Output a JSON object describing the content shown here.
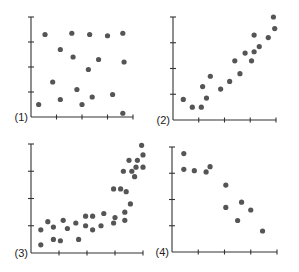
{
  "chart_data": [
    {
      "type": "scatter",
      "panel_label": "(1)",
      "description": "no correlation",
      "frame": {
        "x0": 31,
        "y0": 117,
        "x1": 133,
        "y1": 17
      },
      "xlim": [
        0,
        4
      ],
      "ylim": [
        0,
        4
      ],
      "x_ticks": 4,
      "y_ticks": 4,
      "points": [
        [
          0.3,
          0.5
        ],
        [
          0.55,
          3.3
        ],
        [
          0.85,
          1.4
        ],
        [
          1.15,
          2.7
        ],
        [
          1.15,
          0.7
        ],
        [
          1.6,
          3.35
        ],
        [
          1.65,
          2.4
        ],
        [
          1.8,
          1.1
        ],
        [
          2.0,
          0.5
        ],
        [
          2.3,
          3.3
        ],
        [
          2.25,
          1.9
        ],
        [
          2.4,
          0.8
        ],
        [
          2.65,
          2.3
        ],
        [
          3.0,
          3.25
        ],
        [
          3.2,
          0.9
        ],
        [
          3.6,
          3.35
        ],
        [
          3.65,
          2.2
        ],
        [
          3.6,
          0.15
        ]
      ]
    },
    {
      "type": "scatter",
      "panel_label": "(2)",
      "description": "positive correlation",
      "frame": {
        "x0": 173,
        "y0": 120,
        "x1": 276,
        "y1": 17
      },
      "xlim": [
        0,
        4
      ],
      "ylim": [
        0,
        4
      ],
      "x_ticks": 4,
      "y_ticks": 4,
      "points": [
        [
          0.4,
          0.8
        ],
        [
          0.75,
          0.5
        ],
        [
          1.1,
          0.5
        ],
        [
          1.15,
          1.3
        ],
        [
          1.3,
          0.85
        ],
        [
          1.45,
          1.7
        ],
        [
          1.85,
          1.2
        ],
        [
          2.2,
          1.5
        ],
        [
          2.4,
          2.3
        ],
        [
          2.6,
          1.8
        ],
        [
          2.8,
          2.6
        ],
        [
          3.05,
          2.3
        ],
        [
          3.15,
          2.65
        ],
        [
          3.15,
          3.3
        ],
        [
          3.35,
          2.85
        ],
        [
          3.7,
          3.2
        ],
        [
          3.95,
          3.55
        ],
        [
          3.9,
          4.0
        ]
      ]
    },
    {
      "type": "scatter",
      "panel_label": "(3)",
      "description": "positive non-linear (curved) correlation",
      "frame": {
        "x0": 31,
        "y0": 253,
        "x1": 143,
        "y1": 144
      },
      "xlim": [
        0,
        4
      ],
      "ylim": [
        0,
        4
      ],
      "x_ticks": 4,
      "y_ticks": 4,
      "points": [
        [
          0.35,
          0.3
        ],
        [
          0.35,
          0.85
        ],
        [
          0.6,
          1.15
        ],
        [
          0.8,
          0.5
        ],
        [
          0.8,
          0.95
        ],
        [
          1.05,
          0.45
        ],
        [
          1.15,
          1.2
        ],
        [
          1.3,
          0.9
        ],
        [
          1.6,
          1.1
        ],
        [
          1.7,
          0.5
        ],
        [
          1.95,
          1.35
        ],
        [
          1.95,
          1.0
        ],
        [
          2.2,
          0.85
        ],
        [
          2.2,
          1.35
        ],
        [
          2.5,
          1.0
        ],
        [
          2.6,
          1.45
        ],
        [
          2.95,
          1.1
        ],
        [
          3.0,
          1.3
        ],
        [
          2.95,
          2.35
        ],
        [
          3.2,
          2.35
        ],
        [
          3.35,
          1.5
        ],
        [
          3.35,
          1.2
        ],
        [
          3.4,
          2.25
        ],
        [
          3.55,
          1.8
        ],
        [
          3.3,
          3.0
        ],
        [
          3.5,
          3.4
        ],
        [
          3.6,
          3.0
        ],
        [
          3.7,
          2.8
        ],
        [
          3.75,
          3.15
        ],
        [
          3.8,
          3.4
        ],
        [
          4.0,
          3.6
        ],
        [
          4.0,
          3.15
        ],
        [
          3.95,
          3.95
        ]
      ]
    },
    {
      "type": "scatter",
      "panel_label": "(4)",
      "description": "negative correlation",
      "frame": {
        "x0": 172,
        "y0": 252,
        "x1": 277,
        "y1": 147
      },
      "xlim": [
        0,
        4
      ],
      "ylim": [
        0,
        4
      ],
      "x_ticks": 4,
      "y_ticks": 4,
      "points": [
        [
          0.45,
          3.75
        ],
        [
          0.45,
          3.15
        ],
        [
          0.85,
          3.1
        ],
        [
          1.3,
          3.05
        ],
        [
          1.45,
          3.25
        ],
        [
          2.05,
          2.55
        ],
        [
          2.05,
          1.7
        ],
        [
          2.5,
          1.2
        ],
        [
          2.65,
          1.9
        ],
        [
          3.0,
          1.6
        ],
        [
          3.45,
          0.8
        ]
      ]
    }
  ]
}
